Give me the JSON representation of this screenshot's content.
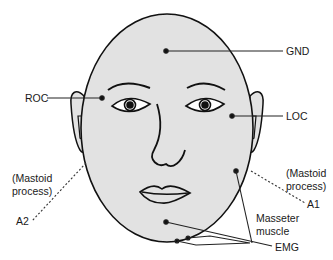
{
  "diagram": {
    "type": "electrode placement diagram (face)",
    "colors": {
      "face_fill": "#e2e2e2",
      "line": "#111111",
      "background": "#ffffff"
    },
    "labels": {
      "gnd": "GND",
      "roc": "ROC",
      "loc": "LOC",
      "mastoid_left_1": "(Mastoid",
      "mastoid_left_2": "process)",
      "a2": "A2",
      "mastoid_right_1": "(Mastoid",
      "mastoid_right_2": "process)",
      "a1": "A1",
      "masseter_1": "Masseter",
      "masseter_2": "muscle",
      "emg": "EMG"
    }
  }
}
